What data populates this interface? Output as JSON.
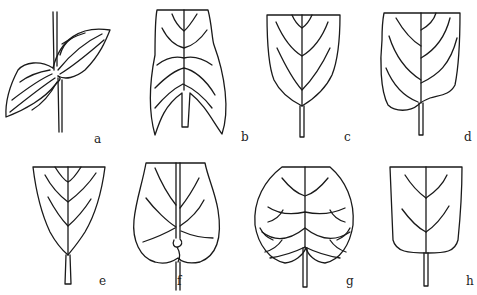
{
  "figure": {
    "panels": [
      {
        "id": "a",
        "label": "a",
        "shape": "perfoliate"
      },
      {
        "id": "b",
        "label": "b",
        "shape": "hastate-like lobed base"
      },
      {
        "id": "c",
        "label": "c",
        "shape": "acute base"
      },
      {
        "id": "d",
        "label": "d",
        "shape": "oblique base"
      },
      {
        "id": "e",
        "label": "e",
        "shape": "cuneate base"
      },
      {
        "id": "f",
        "label": "f",
        "shape": "peltate / clasping base"
      },
      {
        "id": "g",
        "label": "g",
        "shape": "cordate base"
      },
      {
        "id": "h",
        "label": "h",
        "shape": "truncate / rounded base"
      }
    ]
  },
  "colors": {
    "line": "#1a1a1a",
    "background": "#ffffff",
    "label": "#222222"
  }
}
